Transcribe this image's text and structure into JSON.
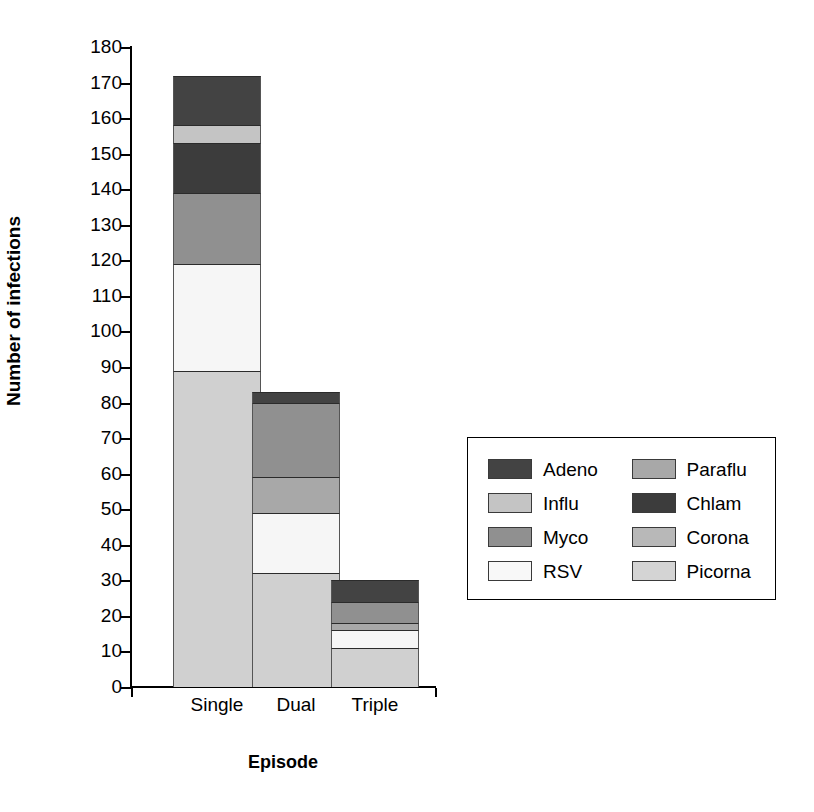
{
  "chart_data": {
    "type": "bar",
    "subtype": "stacked",
    "title": "",
    "xlabel": "Episode",
    "ylabel": "Number of infections",
    "categories": [
      "Single",
      "Dual",
      "Triple"
    ],
    "ylim": [
      0,
      180
    ],
    "ytick_step": 10,
    "yticks": [
      0,
      10,
      20,
      30,
      40,
      50,
      60,
      70,
      80,
      90,
      100,
      110,
      120,
      130,
      140,
      150,
      160,
      170,
      180
    ],
    "grid": false,
    "legend_position": "right",
    "stack_order_bottom_to_top": [
      "Picorna",
      "RSV",
      "Paraflu",
      "Myco",
      "Chlam",
      "Corona",
      "Influ",
      "Adeno"
    ],
    "series": [
      {
        "name": "Picorna",
        "color": "#d0d0d0",
        "values": [
          89,
          32,
          11
        ]
      },
      {
        "name": "RSV",
        "color": "#f6f6f6",
        "values": [
          30,
          17,
          5
        ]
      },
      {
        "name": "Paraflu",
        "color": "#a8a8a8",
        "values": [
          0,
          10,
          2
        ]
      },
      {
        "name": "Myco",
        "color": "#909090",
        "values": [
          20,
          21,
          6
        ]
      },
      {
        "name": "Chlam",
        "color": "#3c3c3c",
        "values": [
          14,
          0,
          0
        ]
      },
      {
        "name": "Corona",
        "color": "#b8b8b8",
        "values": [
          0,
          0,
          0
        ]
      },
      {
        "name": "Influ",
        "color": "#c4c4c4",
        "values": [
          5,
          0,
          0
        ]
      },
      {
        "name": "Adeno",
        "color": "#434343",
        "values": [
          14,
          3,
          6
        ]
      }
    ],
    "totals": [
      172,
      83,
      30
    ],
    "annotations": []
  },
  "legend": {
    "entries": [
      {
        "label": "Adeno",
        "color": "#434343"
      },
      {
        "label": "Paraflu",
        "color": "#a8a8a8"
      },
      {
        "label": "Influ",
        "color": "#c4c4c4"
      },
      {
        "label": "Chlam",
        "color": "#3c3c3c"
      },
      {
        "label": "Myco",
        "color": "#909090"
      },
      {
        "label": "Corona",
        "color": "#b8b8b8"
      },
      {
        "label": "RSV",
        "color": "#f8f8f8"
      },
      {
        "label": "Picorna",
        "color": "#d4d4d4"
      }
    ]
  },
  "axes": {
    "y_title": "Number of infections",
    "x_title": "Episode",
    "y_tick_labels": [
      "180",
      "170",
      "160",
      "150",
      "140",
      "130",
      "120",
      "110",
      "100",
      "90",
      "80",
      "70",
      "60",
      "50",
      "40",
      "30",
      "20",
      "10",
      "0"
    ],
    "x_tick_labels": [
      "Single",
      "Dual",
      "Triple"
    ]
  },
  "colors": {
    "axis": "#000000",
    "background": "#ffffff",
    "segment_border": "#2b2b2b"
  }
}
